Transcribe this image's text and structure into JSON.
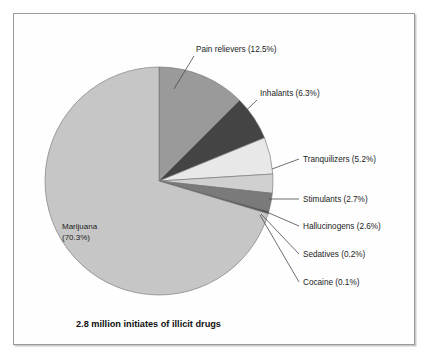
{
  "figure": {
    "caption": "2.8 million initiates of illicit drugs",
    "border_color": "#9a9a9a",
    "background": "#ffffff"
  },
  "chart_data": {
    "type": "pie",
    "title": "",
    "subtitle": "",
    "xlabel": "",
    "ylabel": "",
    "units": "percent",
    "total_label": "2.8 million initiates of illicit drugs",
    "legend_position": "callout-labels",
    "grid": false,
    "categories": [
      "Pain relievers",
      "Inhalants",
      "Tranquilizers",
      "Stimulants",
      "Hallucinogens",
      "Sedatives",
      "Cocaine",
      "Marijuana"
    ],
    "values": [
      12.5,
      6.3,
      5.2,
      2.7,
      2.6,
      0.2,
      0.1,
      70.3
    ],
    "colors": [
      "#9a9a9a",
      "#444444",
      "#e8e8e8",
      "#d0d0d0",
      "#7a7a7a",
      "#3a3a3a",
      "#1f1f1f",
      "#c6c6c6"
    ],
    "slices": [
      {
        "label": "Pain relievers",
        "value": 12.5,
        "label_text": "Pain relievers (12.5%)",
        "color": "#9a9a9a"
      },
      {
        "label": "Inhalants",
        "value": 6.3,
        "label_text": "Inhalants (6.3%)",
        "color": "#444444"
      },
      {
        "label": "Tranquilizers",
        "value": 5.2,
        "label_text": "Tranquilizers (5.2%)",
        "color": "#e8e8e8"
      },
      {
        "label": "Stimulants",
        "value": 2.7,
        "label_text": "Stimulants (2.7%)",
        "color": "#d0d0d0"
      },
      {
        "label": "Hallucinogens",
        "value": 2.6,
        "label_text": "Hallucinogens (2.6%)",
        "color": "#7a7a7a"
      },
      {
        "label": "Sedatives",
        "value": 0.2,
        "label_text": "Sedatives (0.2%)",
        "color": "#3a3a3a"
      },
      {
        "label": "Cocaine",
        "value": 0.1,
        "label_text": "Cocaine (0.1%)",
        "color": "#1f1f1f"
      },
      {
        "label": "Marijuana",
        "value": 70.3,
        "label_text": "Marijuana",
        "label_text2": "(70.3%)",
        "color": "#c6c6c6"
      }
    ]
  },
  "labels": {
    "pain_relievers": "Pain relievers (12.5%)",
    "inhalants": "Inhalants (6.3%)",
    "tranquilizers": "Tranquilizers (5.2%)",
    "stimulants": "Stimulants (2.7%)",
    "hallucinogens": "Hallucinogens (2.6%)",
    "sedatives": "Sedatives (0.2%)",
    "cocaine": "Cocaine (0.1%)",
    "marijuana_line1": "Marijuana",
    "marijuana_line2": "(70.3%)"
  }
}
